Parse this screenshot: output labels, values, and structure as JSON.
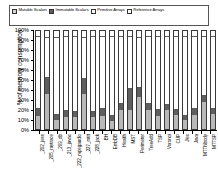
{
  "legend": {
    "items": [
      {
        "label": "Mutable Scalars",
        "key": "mutable_scalars",
        "color": "#d4d4d4"
      },
      {
        "label": "Immutable Scalars",
        "key": "immutable_scalars",
        "color": "#5e5e5e"
      },
      {
        "label": "Primitive Arrays",
        "key": "primitive_arrays",
        "color": "#ffffff"
      },
      {
        "label": "Reference Arrays",
        "key": "reference_arrays",
        "color": "#ffffff"
      }
    ]
  },
  "chart_data": {
    "type": "bar",
    "subtype": "stacked-bar-100-percent",
    "title": "",
    "xlabel": "",
    "ylabel": "% of memory consumption",
    "ylim": [
      0,
      100
    ],
    "yticks": [
      0,
      10,
      20,
      30,
      40,
      50,
      60,
      70,
      80,
      90,
      100
    ],
    "ytick_labels": [
      "0%",
      "10%",
      "20%",
      "30%",
      "40%",
      "50%",
      "60%",
      "70%",
      "80%",
      "90%",
      "100%"
    ],
    "grid": false,
    "legend_position": "top",
    "categories": [
      "_202_jess",
      "_205_raytrace",
      "_209_db",
      "_213_javac",
      "_222_mpegaudio",
      "_227_mtrt",
      "_228_jack",
      "BH",
      "EmbDB",
      "Health",
      "MST",
      "Perimeter",
      "TreeAdd",
      "TSP",
      "Voronoi",
      "CUP",
      "Jlex",
      "Java",
      "MTTNbody",
      "MTTSP"
    ],
    "series": [
      {
        "name": "Mutable Scalars",
        "values": [
          14,
          36,
          9,
          13,
          13,
          36,
          13,
          14,
          8,
          20,
          20,
          33,
          20,
          14,
          20,
          15,
          9,
          15,
          28,
          16
        ]
      },
      {
        "name": "Immutable Scalars",
        "values": [
          7,
          17,
          6,
          6,
          5,
          16,
          5,
          7,
          6,
          6,
          22,
          10,
          6,
          6,
          5,
          5,
          5,
          6,
          6,
          5
        ]
      },
      {
        "name": "Primitive Arrays",
        "values": [
          74,
          41,
          79,
          76,
          77,
          42,
          77,
          74,
          81,
          69,
          53,
          51,
          69,
          75,
          70,
          75,
          81,
          74,
          61,
          74
        ]
      },
      {
        "name": "Reference Arrays",
        "values": [
          5,
          6,
          6,
          5,
          5,
          6,
          5,
          5,
          5,
          5,
          5,
          6,
          5,
          5,
          5,
          5,
          5,
          5,
          5,
          5
        ]
      }
    ]
  }
}
